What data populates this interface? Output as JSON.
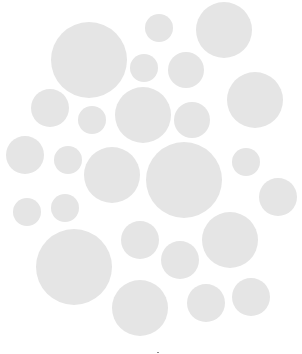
{
  "image": {
    "width": 302,
    "height": 354,
    "background_color": "#ffffff",
    "circle_color": "#e5e5e5"
  },
  "circles": [
    {
      "cx": 89,
      "cy": 60,
      "r": 38
    },
    {
      "cx": 159,
      "cy": 28,
      "r": 14
    },
    {
      "cx": 224,
      "cy": 30,
      "r": 28
    },
    {
      "cx": 144,
      "cy": 68,
      "r": 14
    },
    {
      "cx": 186,
      "cy": 70,
      "r": 18
    },
    {
      "cx": 50,
      "cy": 108,
      "r": 19
    },
    {
      "cx": 92,
      "cy": 120,
      "r": 14
    },
    {
      "cx": 143,
      "cy": 115,
      "r": 28
    },
    {
      "cx": 192,
      "cy": 120,
      "r": 18
    },
    {
      "cx": 255,
      "cy": 100,
      "r": 28
    },
    {
      "cx": 25,
      "cy": 155,
      "r": 19
    },
    {
      "cx": 68,
      "cy": 160,
      "r": 14
    },
    {
      "cx": 112,
      "cy": 175,
      "r": 28
    },
    {
      "cx": 184,
      "cy": 180,
      "r": 38
    },
    {
      "cx": 246,
      "cy": 162,
      "r": 14
    },
    {
      "cx": 278,
      "cy": 197,
      "r": 19
    },
    {
      "cx": 27,
      "cy": 212,
      "r": 14
    },
    {
      "cx": 65,
      "cy": 208,
      "r": 14
    },
    {
      "cx": 140,
      "cy": 240,
      "r": 19
    },
    {
      "cx": 230,
      "cy": 240,
      "r": 28
    },
    {
      "cx": 74,
      "cy": 267,
      "r": 38
    },
    {
      "cx": 180,
      "cy": 260,
      "r": 19
    },
    {
      "cx": 140,
      "cy": 308,
      "r": 28
    },
    {
      "cx": 206,
      "cy": 303,
      "r": 19
    },
    {
      "cx": 251,
      "cy": 297,
      "r": 19
    }
  ],
  "marks": [
    {
      "x": 157,
      "y": 352
    }
  ]
}
